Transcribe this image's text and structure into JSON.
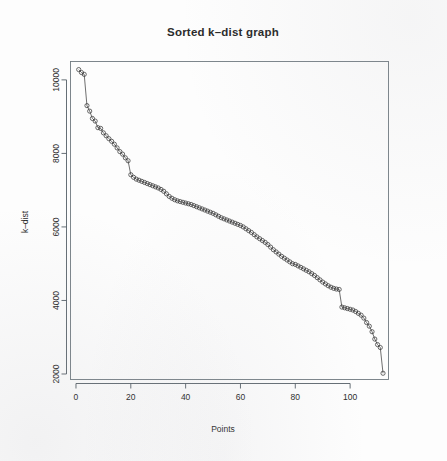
{
  "figure": {
    "background_color": "#fdfdfd",
    "foreground_color": "#2b2b2b",
    "style": "r-base-graphics-scan"
  },
  "chart_data": {
    "type": "line",
    "title": "Sorted k–dist graph",
    "subtitle": "",
    "xlabel": "Points",
    "ylabel": "k–dist",
    "xlim": [
      -2,
      114
    ],
    "ylim": [
      1850,
      10500
    ],
    "grid": false,
    "legend": null,
    "legend_position": "none",
    "marker": "open-circle",
    "line_color": "#4a4a4a",
    "marker_color": "#3a3a3a",
    "xticks": [
      0,
      20,
      40,
      60,
      80,
      100
    ],
    "xtick_labels": [
      "0",
      "20",
      "40",
      "60",
      "80",
      "100"
    ],
    "yticks": [
      2000,
      4000,
      6000,
      8000,
      10000
    ],
    "ytick_labels": [
      "2000",
      "4000",
      "6000",
      "8000",
      "10000"
    ],
    "ytick_label_rotation": 90,
    "annotations": [],
    "series": [
      {
        "name": "k-dist",
        "x": [
          1,
          2,
          3,
          4,
          5,
          6,
          7,
          8,
          9,
          10,
          11,
          12,
          13,
          14,
          15,
          16,
          17,
          18,
          19,
          20,
          21,
          22,
          23,
          24,
          25,
          26,
          27,
          28,
          29,
          30,
          31,
          32,
          33,
          34,
          35,
          36,
          37,
          38,
          39,
          40,
          41,
          42,
          43,
          44,
          45,
          46,
          47,
          48,
          49,
          50,
          51,
          52,
          53,
          54,
          55,
          56,
          57,
          58,
          59,
          60,
          61,
          62,
          63,
          64,
          65,
          66,
          67,
          68,
          69,
          70,
          71,
          72,
          73,
          74,
          75,
          76,
          77,
          78,
          79,
          80,
          81,
          82,
          83,
          84,
          85,
          86,
          87,
          88,
          89,
          90,
          91,
          92,
          93,
          94,
          95,
          96,
          97,
          98,
          99,
          100,
          101,
          102,
          103,
          104,
          105,
          106,
          107,
          108,
          109,
          110,
          111,
          112
        ],
        "values": [
          10280,
          10200,
          10150,
          9300,
          9150,
          8950,
          8880,
          8700,
          8680,
          8560,
          8480,
          8400,
          8330,
          8250,
          8150,
          8050,
          7980,
          7880,
          7800,
          7420,
          7350,
          7300,
          7270,
          7240,
          7210,
          7180,
          7150,
          7120,
          7090,
          7060,
          7020,
          6970,
          6900,
          6830,
          6780,
          6740,
          6710,
          6690,
          6670,
          6650,
          6630,
          6610,
          6580,
          6550,
          6520,
          6490,
          6460,
          6430,
          6400,
          6370,
          6330,
          6290,
          6250,
          6220,
          6190,
          6160,
          6130,
          6100,
          6070,
          6040,
          6000,
          5950,
          5900,
          5850,
          5790,
          5730,
          5680,
          5630,
          5580,
          5520,
          5450,
          5380,
          5320,
          5260,
          5200,
          5150,
          5100,
          5050,
          5000,
          4980,
          4940,
          4900,
          4860,
          4820,
          4780,
          4730,
          4680,
          4620,
          4560,
          4500,
          4450,
          4400,
          4360,
          4330,
          4310,
          4300,
          3820,
          3800,
          3780,
          3760,
          3740,
          3700,
          3650,
          3600,
          3520,
          3400,
          3300,
          3150,
          2950,
          2800,
          2720,
          2020
        ]
      }
    ]
  }
}
